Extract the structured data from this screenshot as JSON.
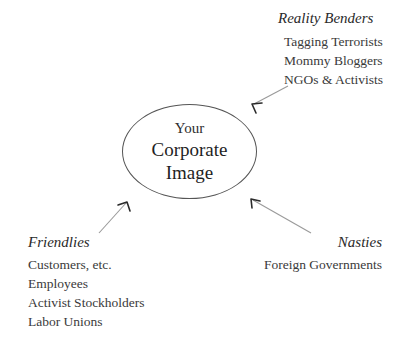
{
  "diagram": {
    "type": "influence-map",
    "center": {
      "line_1": "Your",
      "line_2": "Corporate",
      "line_3": "Image"
    },
    "groups": [
      {
        "id": "reality-benders",
        "title": "Reality Benders",
        "position": "top-right",
        "items": [
          "Tagging Terrorists",
          "Mommy Bloggers",
          "NGOs & Activists"
        ]
      },
      {
        "id": "friendlies",
        "title": "Friendlies",
        "position": "bottom-left",
        "items": [
          "Customers, etc.",
          "Employees",
          "Activist Stockholders",
          "Labor Unions"
        ]
      },
      {
        "id": "nasties",
        "title": "Nasties",
        "position": "bottom-right",
        "items": [
          "Foreign Governments"
        ]
      }
    ],
    "arrows": [
      {
        "id": "arrow-reality-benders",
        "from": "reality-benders",
        "to": "center",
        "direction": "down-left"
      },
      {
        "id": "arrow-friendlies",
        "from": "friendlies",
        "to": "center",
        "direction": "up-right"
      },
      {
        "id": "arrow-nasties",
        "from": "nasties",
        "to": "center",
        "direction": "up-left"
      }
    ],
    "colors": {
      "background": "#ffffff",
      "node_stroke": "#555555",
      "arrow_stroke": "#9a9a9a",
      "arrow_head": "#2b2b2b",
      "text": "#3a3a3a"
    }
  }
}
